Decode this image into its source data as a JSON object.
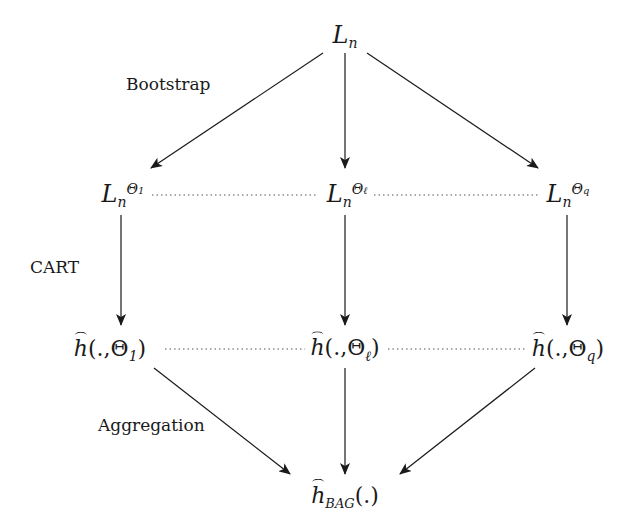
{
  "diagram": {
    "type": "flow",
    "nodes": {
      "root": {
        "symbol": "L",
        "sub": "n"
      },
      "boot1": {
        "symbol": "L",
        "sub": "n",
        "sup": "Θ",
        "sup_index": "1"
      },
      "bootl": {
        "symbol": "L",
        "sub": "n",
        "sup": "Θ",
        "sup_index": "ℓ"
      },
      "bootq": {
        "symbol": "L",
        "sub": "n",
        "sup": "Θ",
        "sup_index": "q"
      },
      "h1": {
        "prefix": "h",
        "args": "(.,Θ",
        "index": "1",
        "close": ")"
      },
      "hl": {
        "prefix": "h",
        "args": "(.,Θ",
        "index": "ℓ",
        "close": ")"
      },
      "hq": {
        "prefix": "h",
        "args": "(.,Θ",
        "index": "q",
        "close": ")"
      },
      "hbag": {
        "prefix": "h",
        "sub": "BAG",
        "args": "(.)"
      }
    },
    "labels": {
      "bootstrap": "Bootstrap",
      "cart": "CART",
      "aggregation": "Aggregation"
    },
    "edges": [
      [
        "root",
        "boot1"
      ],
      [
        "root",
        "bootl"
      ],
      [
        "root",
        "bootq"
      ],
      [
        "boot1",
        "h1"
      ],
      [
        "bootl",
        "hl"
      ],
      [
        "bootq",
        "hq"
      ],
      [
        "h1",
        "hbag"
      ],
      [
        "hl",
        "hbag"
      ],
      [
        "hq",
        "hbag"
      ]
    ],
    "dotted_links": [
      [
        "boot1",
        "bootl"
      ],
      [
        "bootl",
        "bootq"
      ],
      [
        "h1",
        "hl"
      ],
      [
        "hl",
        "hq"
      ]
    ]
  }
}
